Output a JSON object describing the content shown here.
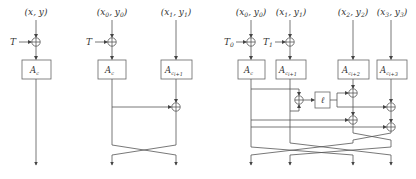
{
  "diagrams": [
    {
      "inputs": [
        {
          "label": "(x, y)"
        }
      ],
      "tweaks": [
        {
          "label": "T"
        }
      ],
      "boxes": [
        {
          "label": "A",
          "sub": "c",
          "subsub": "i"
        }
      ]
    },
    {
      "inputs": [
        {
          "label": "(x0, y0)",
          "main": "(x",
          "s1": "0",
          "mid": ", y",
          "s2": "0",
          "end": ")"
        },
        {
          "label": "(x1, y1)",
          "main": "(x",
          "s1": "1",
          "mid": ", y",
          "s2": "1",
          "end": ")"
        }
      ],
      "tweaks": [
        {
          "label": "T"
        }
      ],
      "boxes": [
        {
          "label": "A",
          "sub": "c",
          "subsub": "i"
        },
        {
          "label": "A",
          "sub": "c",
          "subsub": "i+1"
        }
      ]
    },
    {
      "inputs": [
        {
          "main": "(x",
          "s1": "0",
          "mid": ", y",
          "s2": "0",
          "end": ")"
        },
        {
          "main": "(x",
          "s1": "1",
          "mid": ", y",
          "s2": "1",
          "end": ")"
        },
        {
          "main": "(x",
          "s1": "2",
          "mid": ", y",
          "s2": "2",
          "end": ")"
        },
        {
          "main": "(x",
          "s1": "3",
          "mid": ", y",
          "s2": "3",
          "end": ")"
        }
      ],
      "tweaks": [
        {
          "label": "T",
          "sub": "0"
        },
        {
          "label": "T",
          "sub": "1"
        }
      ],
      "boxes": [
        {
          "label": "A",
          "sub": "c",
          "subsub": "i"
        },
        {
          "label": "A",
          "sub": "c",
          "subsub": "i+1"
        },
        {
          "label": "A",
          "sub": "c",
          "subsub": "i+2"
        },
        {
          "label": "A",
          "sub": "c",
          "subsub": "i+3"
        }
      ],
      "mix_box": {
        "label": "ℓ"
      }
    }
  ]
}
